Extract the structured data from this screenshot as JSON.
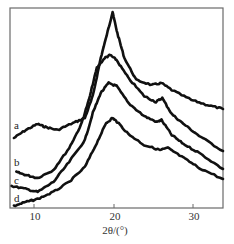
{
  "chart_data": {
    "type": "line",
    "title": "",
    "xlabel": "2θ/(°)",
    "ylabel": "",
    "xlim": [
      7.0,
      34.0
    ],
    "ylim": [
      0,
      200
    ],
    "grid": false,
    "legend": "inline labels at left (a, b, c, d)",
    "xticks": [
      10,
      20,
      30
    ],
    "xtick_labels": [
      "10",
      "20",
      "30"
    ],
    "series": [
      {
        "name": "a",
        "x": [
          7.5,
          9.0,
          10.5,
          11.5,
          13.0,
          15.0,
          16.5,
          17.5,
          18.5,
          19.5,
          20.0,
          20.6,
          21.5,
          23.0,
          25.0,
          26.2,
          27.5,
          30.0,
          32.0,
          34.0
        ],
        "y": [
          70,
          78,
          84,
          81,
          78,
          85,
          90,
          112,
          150,
          180,
          196,
          175,
          150,
          128,
          123,
          125,
          118,
          108,
          103,
          99
        ]
      },
      {
        "name": "b",
        "x": [
          7.8,
          9.0,
          10.5,
          12.5,
          14.5,
          16.0,
          17.0,
          18.0,
          19.0,
          19.7,
          20.5,
          22.0,
          24.0,
          25.5,
          26.3,
          27.5,
          29.0,
          31.0,
          34.0
        ],
        "y": [
          36,
          33,
          30,
          38,
          60,
          83,
          108,
          140,
          150,
          153,
          148,
          130,
          112,
          106,
          110,
          94,
          84,
          72,
          57
        ]
      },
      {
        "name": "c",
        "x": [
          7.2,
          9.0,
          10.5,
          12.5,
          14.5,
          16.5,
          17.5,
          18.5,
          19.5,
          20.5,
          22.0,
          24.0,
          25.6,
          26.2,
          27.5,
          29.0,
          31.0,
          34.0
        ],
        "y": [
          22,
          19,
          16,
          26,
          46,
          68,
          95,
          115,
          125,
          122,
          105,
          92,
          86,
          88,
          73,
          64,
          55,
          39
        ]
      },
      {
        "name": "d",
        "x": [
          7.5,
          9.0,
          10.5,
          12.5,
          14.5,
          16.5,
          18.0,
          19.2,
          20.0,
          20.6,
          22.0,
          24.0,
          26.0,
          27.0,
          29.0,
          31.0,
          34.0
        ],
        "y": [
          2,
          6,
          9,
          16,
          26,
          41,
          65,
          85,
          90,
          86,
          74,
          63,
          58,
          60,
          50,
          40,
          29
        ]
      }
    ]
  },
  "labels": {
    "a": "a",
    "b": "b",
    "c": "c",
    "d": "d",
    "xaxis": "2θ/(°)",
    "tick_10": "10",
    "tick_20": "20",
    "tick_30": "30"
  }
}
